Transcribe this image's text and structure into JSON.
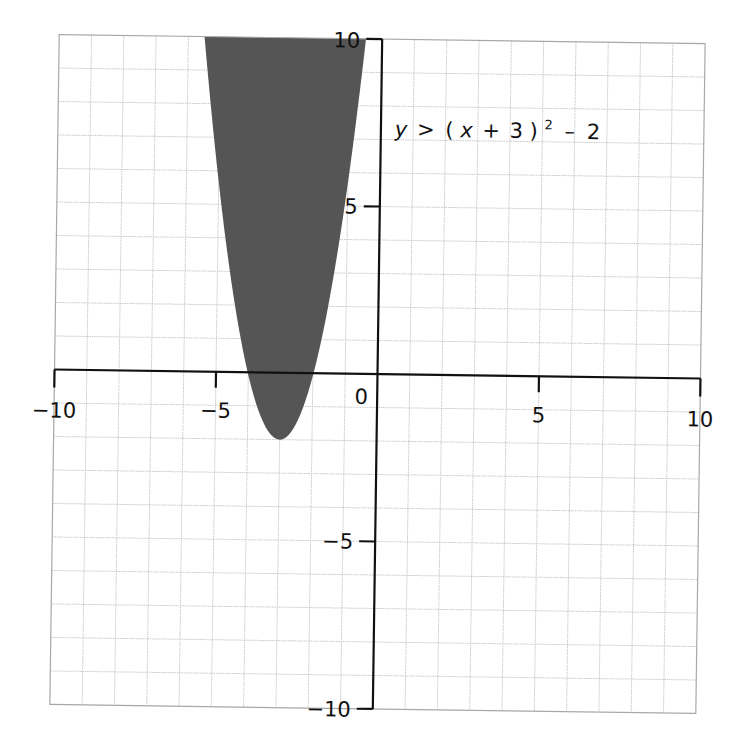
{
  "chart_data": {
    "type": "inequality-region",
    "title": "",
    "equation_label": {
      "lhs": "y",
      "op": ">",
      "paren_open": "(",
      "var": "x",
      "plus": "+",
      "const": "3",
      "paren_close": ")",
      "exponent": "2",
      "minus": "–",
      "offset": "2",
      "full_text": "y > (x + 3)² – 2"
    },
    "inequality": {
      "form": "y > a(x - h)^2 + k",
      "a": 1,
      "h": -3,
      "k": -2,
      "strict": true
    },
    "vertex": [
      -3,
      -2
    ],
    "shaded_region": "inside (above) the parabola",
    "xlim": [
      -10,
      10
    ],
    "ylim": [
      -10,
      10
    ],
    "grid": true,
    "grid_step": 1,
    "x_ticks": [
      {
        "value": -10,
        "label": "−10"
      },
      {
        "value": -5,
        "label": "−5"
      },
      {
        "value": 0,
        "label": "0"
      },
      {
        "value": 5,
        "label": "5"
      },
      {
        "value": 10,
        "label": "10"
      }
    ],
    "y_ticks": [
      {
        "value": 10,
        "label": "10"
      },
      {
        "value": 5,
        "label": "5"
      },
      {
        "value": -5,
        "label": "−5"
      },
      {
        "value": -10,
        "label": "−10"
      }
    ],
    "xlabel": "",
    "ylabel": "",
    "colors": {
      "shading": "#555555",
      "grid": "#c9c9c9",
      "axis": "#111111",
      "frame": "#a8a8a8"
    }
  },
  "labels": {
    "x_tick_m10": "−10",
    "x_tick_m5": "−5",
    "origin": "0",
    "x_tick_5": "5",
    "x_tick_10": "10",
    "y_tick_10": "10",
    "y_tick_5": "5",
    "y_tick_m5": "−5",
    "y_tick_m10": "−10"
  }
}
